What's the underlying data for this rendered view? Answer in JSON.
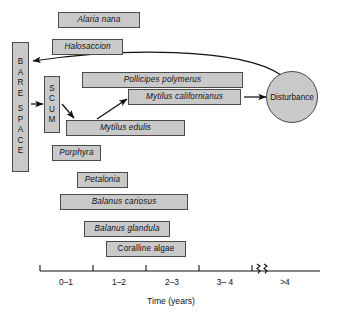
{
  "figure": {
    "type": "successional-flow-diagram",
    "background_color": "#ffffff",
    "box_fill_color": "#c9c9c9",
    "box_border_color": "#4a4a4a",
    "text_color": "#111111"
  },
  "nodes": {
    "bare_space": {
      "label": "BARE SPACE",
      "letters": [
        "B",
        "A",
        "R",
        "E",
        "",
        "S",
        "P",
        "A",
        "C",
        "E"
      ],
      "shape": "vertical-box"
    },
    "scum": {
      "label": "SCUM",
      "letters": [
        "S",
        "C",
        "U",
        "M"
      ],
      "shape": "vertical-box"
    },
    "disturbance": {
      "label": "Disturbance",
      "shape": "circle"
    }
  },
  "species": [
    {
      "name": "Alaria nana",
      "italic": true
    },
    {
      "name": "Halosaccion",
      "italic": true
    },
    {
      "name": "Pollicipes polymerus",
      "italic": true
    },
    {
      "name": "Mytilus  californianus",
      "italic": true
    },
    {
      "name": "Mytilus  edulis",
      "italic": true
    },
    {
      "name": "Porphyra",
      "italic": true
    },
    {
      "name": "Petalonia",
      "italic": true
    },
    {
      "name": "Balanus cariosus",
      "italic": true
    },
    {
      "name": "Balanus glandula",
      "italic": true
    },
    {
      "name": "Coralline algae",
      "italic": false
    }
  ],
  "axis": {
    "title": "Time (years)",
    "tick_labels": [
      "0–1",
      "1–2",
      "2–3",
      "3– 4",
      ">4"
    ],
    "has_break": true,
    "break_symbol": "zigzag"
  },
  "arrows": [
    {
      "from": "bare_space",
      "to": "scum",
      "style": "straight"
    },
    {
      "from": "scum",
      "to": "Mytilus  edulis",
      "style": "straight"
    },
    {
      "from": "Mytilus  edulis",
      "to": "Mytilus  californianus",
      "style": "straight"
    },
    {
      "from": "Mytilus  californianus",
      "to": "disturbance",
      "style": "straight"
    },
    {
      "from": "disturbance",
      "to": "bare_space",
      "style": "curved"
    }
  ]
}
